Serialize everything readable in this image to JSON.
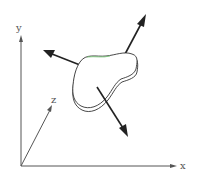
{
  "figure": {
    "axes": {
      "x_label": "x",
      "y_label": "y",
      "z_label": "z"
    },
    "vectors": [
      {
        "name": "upper-right-vector",
        "direction": "up-right"
      },
      {
        "name": "left-vector",
        "direction": "up-left"
      },
      {
        "name": "lower-right-vector",
        "direction": "down-right"
      }
    ],
    "colors": {
      "axes": "#555555",
      "vectors": "#222222",
      "surface_edge": "#333333",
      "highlight_edge": "#7ac77a"
    }
  }
}
